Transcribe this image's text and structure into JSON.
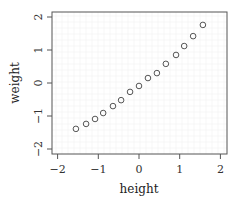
{
  "chart_data": {
    "type": "scatter",
    "title": "",
    "xlabel": "height",
    "ylabel": "weight",
    "xlim": [
      -2,
      2
    ],
    "ylim": [
      -2,
      2
    ],
    "x_ticks": [
      -2,
      -1,
      0,
      1,
      2
    ],
    "y_ticks": [
      -2,
      -1,
      0,
      1,
      2
    ],
    "x_tick_labels": [
      "−2",
      "−1",
      "0",
      "1",
      "2"
    ],
    "y_tick_labels": [
      "−2",
      "−1",
      "0",
      "1",
      "2"
    ],
    "grid": true,
    "legend": null,
    "marker": "open-circle",
    "series": [
      {
        "name": "points",
        "x": [
          -1.55,
          -1.3,
          -1.08,
          -0.88,
          -0.64,
          -0.44,
          -0.22,
          0.0,
          0.22,
          0.44,
          0.66,
          0.91,
          1.11,
          1.33,
          1.57
        ],
        "y": [
          -1.39,
          -1.24,
          -1.09,
          -0.91,
          -0.7,
          -0.52,
          -0.27,
          -0.09,
          0.15,
          0.3,
          0.58,
          0.85,
          1.12,
          1.42,
          1.76
        ]
      }
    ]
  },
  "colors": {
    "frame": "#555555",
    "grid": "#ececec",
    "marker": "#555555",
    "text": "#333333"
  }
}
